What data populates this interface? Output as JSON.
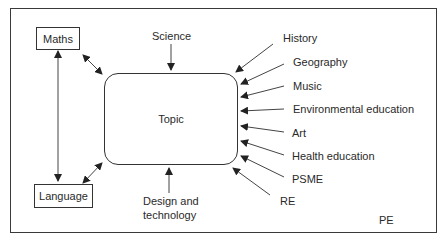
{
  "diagram": {
    "center": {
      "label": "Topic"
    },
    "core_subjects": [
      {
        "label": "Maths"
      },
      {
        "label": "Language"
      }
    ],
    "subjects": [
      {
        "label": "Science"
      },
      {
        "label": "History"
      },
      {
        "label": "Geography"
      },
      {
        "label": "Music"
      },
      {
        "label": "Environmental education"
      },
      {
        "label": "Art"
      },
      {
        "label": "Health education"
      },
      {
        "label": "PSME"
      },
      {
        "label": "RE"
      },
      {
        "label": "PE"
      }
    ],
    "design_technology": {
      "line1": "Design and",
      "line2": "technology"
    }
  }
}
